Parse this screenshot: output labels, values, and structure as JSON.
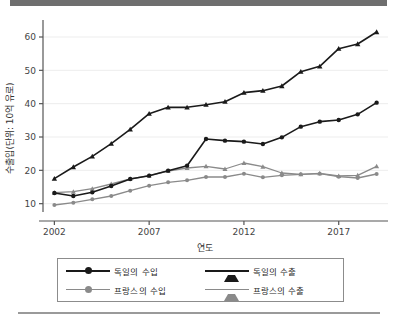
{
  "chart_data": {
    "type": "line",
    "title": "",
    "xlabel": "연도",
    "ylabel": "수출입(단위: 10억 유로)",
    "x": [
      2002,
      2003,
      2004,
      2005,
      2006,
      2007,
      2008,
      2009,
      2010,
      2011,
      2012,
      2013,
      2014,
      2015,
      2016,
      2017,
      2018,
      2019
    ],
    "xticks": [
      2002,
      2007,
      2012,
      2017
    ],
    "xtick_labels": [
      "2002",
      "2007",
      "2012",
      "2017"
    ],
    "yticks": [
      10,
      20,
      30,
      40,
      50,
      60
    ],
    "ytick_labels": [
      "10",
      "20",
      "30",
      "40",
      "50",
      "60"
    ],
    "xlim": [
      2001.4,
      2019.6
    ],
    "ylim": [
      7.5,
      64.5
    ],
    "grid": "horizontal",
    "legend_position": "bottom",
    "series": [
      {
        "name": "독일의 수입",
        "color": "#1a1a1a",
        "marker": "circle",
        "values": [
          13.2,
          12.3,
          13.4,
          15.3,
          17.4,
          18.4,
          19.9,
          21.4,
          29.4,
          28.9,
          28.6,
          27.9,
          29.9,
          33.1,
          34.6,
          35.1,
          36.8,
          40.3
        ]
      },
      {
        "name": "독일의 수출",
        "color": "#1a1a1a",
        "marker": "triangle",
        "values": [
          17.5,
          21.0,
          24.2,
          28.0,
          32.3,
          37.0,
          38.9,
          38.9,
          39.7,
          40.6,
          43.3,
          43.9,
          45.3,
          49.6,
          51.2,
          56.5,
          57.9,
          61.5
        ]
      },
      {
        "name": "프랑스의 수입",
        "color": "#8a8a8a",
        "marker": "circle",
        "values": [
          9.6,
          10.3,
          11.3,
          12.3,
          13.9,
          15.4,
          16.4,
          17.0,
          18.0,
          18.0,
          19.0,
          17.9,
          18.5,
          18.8,
          19.0,
          18.1,
          17.7,
          18.9
        ]
      },
      {
        "name": "프랑스의 수출",
        "color": "#8a8a8a",
        "marker": "triangle",
        "values": [
          13.3,
          13.6,
          14.5,
          15.9,
          17.4,
          18.4,
          19.8,
          20.7,
          21.2,
          20.4,
          22.2,
          21.1,
          19.2,
          18.8,
          19.1,
          18.3,
          18.5,
          21.2
        ]
      }
    ]
  },
  "legend": {
    "entries": [
      {
        "label": "독일의 수입"
      },
      {
        "label": "독일의 수출"
      },
      {
        "label": "프랑스의 수입"
      },
      {
        "label": "프랑스의 수출"
      }
    ]
  },
  "colors": {
    "germany": "#1a1a1a",
    "france": "#8a8a8a",
    "grid": "#ededed",
    "axis": "#555555",
    "top_bar": "#6e6e6e",
    "bottom_rule": "#9a9a9a"
  }
}
